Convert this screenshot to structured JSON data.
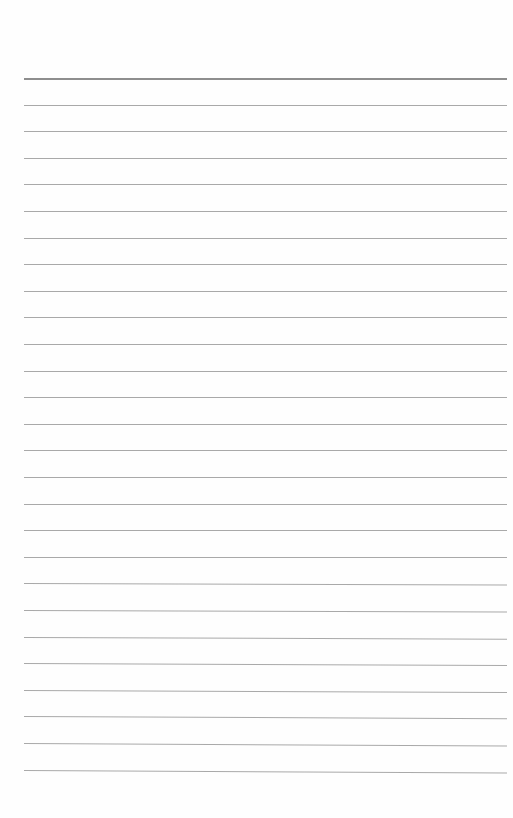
{
  "document": {
    "type": "lined paper",
    "line_count": 27,
    "first_line_y": 78,
    "line_spacing": 26.6,
    "line_left": 24,
    "line_width": 483,
    "colors": {
      "paper": "#fefefe",
      "rule": "#a9a9a9",
      "top_rule": "#8e8e8e"
    }
  }
}
